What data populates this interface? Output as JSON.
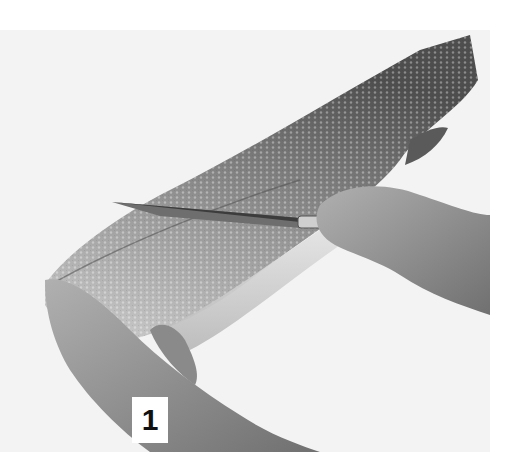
{
  "photo": {
    "subject": "whole salmon being filleted with a knife, two hands",
    "style": "grayscale photograph",
    "colors": {
      "background": "#f3f3f3",
      "fish_dark": "#4a4a4a",
      "fish_mid": "#8c8c8c",
      "fish_light": "#d6d6d6",
      "skin": "#9a9a9a",
      "knife": "#7a7a7a"
    }
  },
  "step": {
    "number": "1"
  }
}
